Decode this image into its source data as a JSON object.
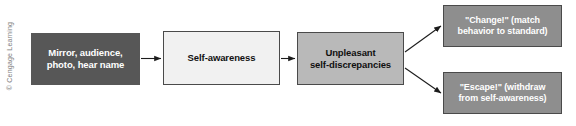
{
  "figure": {
    "background_color": "#ffffff",
    "width": 576,
    "height": 126
  },
  "credit": {
    "text": "© Cengage Learning",
    "color": "#7d7d7d"
  },
  "nodes": [
    {
      "id": "source",
      "name": "node-source",
      "lines": [
        "Mirror, audience,",
        "photo, hear name"
      ],
      "line1": "Mirror, audience,",
      "line2": "photo, hear name",
      "fill": "#575757",
      "text_color": "#ffffff",
      "border_color": "#575757"
    },
    {
      "id": "selfawareness",
      "name": "node-self-awareness",
      "lines": [
        "Self-awareness"
      ],
      "line1": "Self-awareness",
      "line2": "",
      "fill": "#f1f1f1",
      "text_color": "#111111",
      "border_color": "#4a4a4a"
    },
    {
      "id": "discrepancies",
      "name": "node-unpleasant-self-discrepancies",
      "lines": [
        "Unpleasant",
        "self-discrepancies"
      ],
      "line1": "Unpleasant",
      "line2": "self-discrepancies",
      "fill": "#b9b9b9",
      "text_color": "#101010",
      "border_color": "#4a4a4a"
    },
    {
      "id": "change",
      "name": "node-change-outcome",
      "lines": [
        "\"Change!\" (match",
        "behavior to standard)"
      ],
      "line1": "\"Change!\" (match",
      "line2": "behavior to standard)",
      "fill": "#8e8e8e",
      "text_color": "#ffffff",
      "border_color": "#4a4a4a"
    },
    {
      "id": "escape",
      "name": "node-escape-outcome",
      "lines": [
        "\"Escape!\" (withdraw",
        "from self-awareness)"
      ],
      "line1": "\"Escape!\" (withdraw",
      "line2": "from self-awareness)",
      "fill": "#8e8e8e",
      "text_color": "#ffffff",
      "border_color": "#4a4a4a"
    }
  ],
  "connectors": [
    {
      "id": "arrow-source-to-selfawareness",
      "from": "source",
      "to": "selfawareness",
      "style": "straight",
      "color": "#1c1c1c"
    },
    {
      "id": "arrow-selfawareness-to-discrepancies",
      "from": "selfawareness",
      "to": "discrepancies",
      "style": "straight",
      "color": "#1c1c1c"
    },
    {
      "id": "arrow-discrepancies-to-change",
      "from": "discrepancies",
      "to": "change",
      "style": "diagonal-up",
      "color": "#1c1c1c"
    },
    {
      "id": "arrow-discrepancies-to-escape",
      "from": "discrepancies",
      "to": "escape",
      "style": "diagonal-down",
      "color": "#1c1c1c"
    }
  ]
}
